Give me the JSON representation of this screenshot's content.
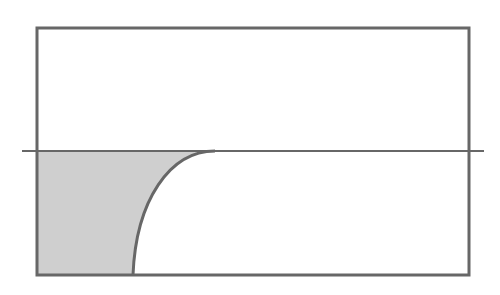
{
  "diagram": {
    "colors": {
      "stroke": "#676767",
      "fill": "#cfcfcf",
      "background": "#ffffff"
    },
    "container": {
      "x": 37,
      "y": 28,
      "width": 432,
      "height": 247
    },
    "level_line": {
      "y": 151,
      "x1": 22,
      "x2": 484
    },
    "curve": {
      "start": {
        "x": 133,
        "y": 275
      },
      "control1": {
        "x": 136,
        "y": 200
      },
      "control2": {
        "x": 170,
        "y": 151
      },
      "end": {
        "x": 215,
        "y": 151
      }
    }
  }
}
